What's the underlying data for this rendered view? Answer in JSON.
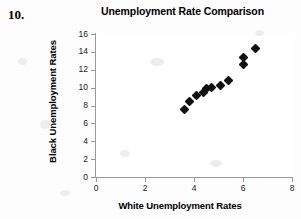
{
  "question_number": "10.",
  "chart_data": {
    "type": "scatter",
    "title": "Unemployment Rate Comparison",
    "xlabel": "White Unemployment Rates",
    "ylabel": "Black Unemployment Rates",
    "xlim": [
      0,
      8
    ],
    "ylim": [
      0,
      16
    ],
    "xticks": [
      "0",
      "2",
      "4",
      "6",
      "8"
    ],
    "xtick_values": [
      0,
      2,
      4,
      6,
      8
    ],
    "yticks": [
      "0",
      "2",
      "4",
      "6",
      "8",
      "10",
      "12",
      "14",
      "16"
    ],
    "ytick_values": [
      0,
      2,
      4,
      6,
      8,
      10,
      12,
      14,
      16
    ],
    "grid": false,
    "legend": false,
    "marker": "diamond",
    "marker_color": "#111111",
    "points": [
      {
        "x": 3.6,
        "y": 7.6
      },
      {
        "x": 3.8,
        "y": 8.5
      },
      {
        "x": 4.1,
        "y": 9.1
      },
      {
        "x": 4.4,
        "y": 9.5
      },
      {
        "x": 4.5,
        "y": 9.9
      },
      {
        "x": 4.7,
        "y": 10.0
      },
      {
        "x": 5.1,
        "y": 10.2
      },
      {
        "x": 5.4,
        "y": 10.8
      },
      {
        "x": 6.0,
        "y": 12.6
      },
      {
        "x": 6.0,
        "y": 13.4
      },
      {
        "x": 6.5,
        "y": 14.4
      }
    ]
  }
}
